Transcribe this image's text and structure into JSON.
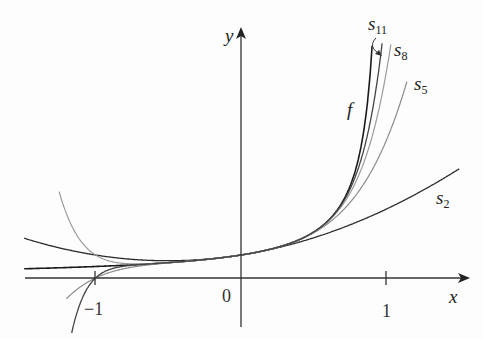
{
  "chart_data": {
    "type": "line",
    "title": "",
    "xlabel": "x",
    "ylabel": "y",
    "x_ticks": [
      {
        "value": -1,
        "label": "−1"
      },
      {
        "value": 0,
        "label": "0"
      },
      {
        "value": 1,
        "label": "1"
      }
    ],
    "xlim": [
      -1.5,
      1.5
    ],
    "ylim": [
      -2.7,
      10
    ],
    "grid": false,
    "function": "f(x) = 1/(1 - x)",
    "series": [
      {
        "name": "f",
        "label": "f",
        "formula": "1/(1-x)",
        "color": "#1a1a1a"
      },
      {
        "name": "s2",
        "label": "s",
        "sub": "2",
        "formula": "sum_{k=0..2} x^k",
        "color": "#2a2a2a"
      },
      {
        "name": "s5",
        "label": "s",
        "sub": "5",
        "formula": "sum_{k=0..5} x^k",
        "color": "#8a8a8a"
      },
      {
        "name": "s8",
        "label": "s",
        "sub": "8",
        "formula": "sum_{k=0..8} x^k",
        "color": "#9a9a9a"
      },
      {
        "name": "s11",
        "label": "s",
        "sub": "11",
        "formula": "sum_{k=0..11} x^k",
        "color": "#444444"
      }
    ],
    "sample_points": {
      "x": [
        -1,
        -0.5,
        0,
        0.5,
        0.9
      ],
      "f": [
        0.5,
        0.667,
        1,
        2,
        10
      ],
      "s2": [
        1,
        0.75,
        1,
        1.75,
        2.71
      ],
      "s5": [
        0,
        0.656,
        1,
        1.969,
        4.686
      ],
      "s8": [
        1,
        0.668,
        1,
        1.998,
        6.126
      ],
      "s11": [
        0,
        0.667,
        1,
        2.0,
        7.176
      ]
    },
    "annotations": [
      {
        "text": "s11",
        "arrow_to": "s11 curve top"
      }
    ]
  },
  "labels": {
    "x_axis": "x",
    "y_axis": "y",
    "origin": "0",
    "tick_pos1": "1",
    "tick_neg1": "−1",
    "f": "f",
    "s": "s",
    "s2_sub": "2",
    "s5_sub": "5",
    "s8_sub": "8",
    "s11_sub": "11"
  }
}
